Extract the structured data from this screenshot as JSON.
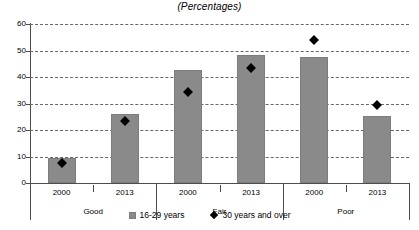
{
  "chart_data": {
    "type": "bar",
    "title": "(Percentages)",
    "xlabel": "",
    "ylabel": "",
    "ylim": [
      0,
      60
    ],
    "yticks": [
      0,
      10,
      20,
      30,
      40,
      50,
      60
    ],
    "grid": true,
    "legend_position": "bottom",
    "categories": [
      "2000",
      "2013",
      "2000",
      "2013",
      "2000",
      "2013"
    ],
    "groups": [
      {
        "label": "Good",
        "categories": [
          "2000",
          "2013"
        ]
      },
      {
        "label": "Fair",
        "categories": [
          "2000",
          "2013"
        ]
      },
      {
        "label": "Poor",
        "categories": [
          "2000",
          "2013"
        ]
      }
    ],
    "series": [
      {
        "name": "16-29 years",
        "marker": "bar",
        "color": "#8a8a8a",
        "values": [
          9.3,
          26.1,
          42.7,
          48.4,
          47.5,
          25.3
        ]
      },
      {
        "name": "30 years and over",
        "marker": "diamond",
        "color": "#000000",
        "values": [
          9.0,
          24.8,
          35.8,
          44.7,
          55.4,
          30.6
        ]
      }
    ]
  },
  "legend": {
    "items": [
      {
        "label": "16-29 years",
        "marker": "bar"
      },
      {
        "label": "30 years and over",
        "marker": "diamond"
      }
    ]
  }
}
